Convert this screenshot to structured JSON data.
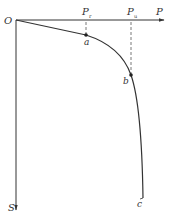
{
  "diagram": {
    "type": "load-settlement curve (P-S)",
    "axes": {
      "origin_label": "O",
      "x_label": "P",
      "y_label": "S"
    },
    "markers": {
      "pr": {
        "main": "P",
        "sub": "r"
      },
      "pu": {
        "main": "P",
        "sub": "u"
      }
    },
    "points": {
      "a": "a",
      "b": "b",
      "c": "c"
    },
    "colors": {
      "line": "#333333",
      "dashed": "#555555",
      "background": "#ffffff"
    }
  }
}
